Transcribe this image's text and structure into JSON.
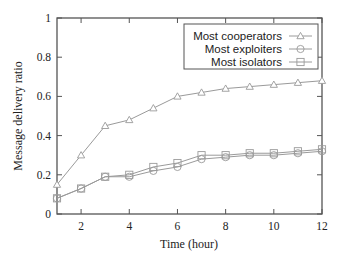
{
  "chart_data": {
    "type": "line",
    "title": "",
    "xlabel": "Time (hour)",
    "ylabel": "Message delivery ratio",
    "x": [
      1,
      2,
      3,
      4,
      5,
      6,
      7,
      8,
      9,
      10,
      11,
      12
    ],
    "xlim": [
      1,
      12
    ],
    "ylim": [
      0,
      1
    ],
    "xticks": [
      2,
      4,
      6,
      8,
      10,
      12
    ],
    "xtick_labels": [
      "2",
      "4",
      "6",
      "8",
      "10",
      "12"
    ],
    "yticks": [
      0,
      0.2,
      0.4,
      0.6,
      0.8,
      1
    ],
    "ytick_labels": [
      "0",
      "0.2",
      "0.4",
      "0.6",
      "0.8",
      "1"
    ],
    "grid": false,
    "legend_position": "upper right",
    "series": [
      {
        "name": "Most cooperators",
        "marker": "triangle",
        "values": [
          0.15,
          0.3,
          0.45,
          0.48,
          0.54,
          0.6,
          0.62,
          0.64,
          0.65,
          0.66,
          0.67,
          0.68
        ]
      },
      {
        "name": "Most exploiters",
        "marker": "circle",
        "values": [
          0.08,
          0.13,
          0.19,
          0.19,
          0.22,
          0.24,
          0.28,
          0.29,
          0.3,
          0.3,
          0.31,
          0.32
        ]
      },
      {
        "name": "Most isolators",
        "marker": "square",
        "values": [
          0.08,
          0.13,
          0.19,
          0.2,
          0.24,
          0.26,
          0.3,
          0.3,
          0.31,
          0.31,
          0.32,
          0.33
        ]
      }
    ],
    "colors": {
      "axis": "#555555",
      "series_line": "#9a9a9a",
      "text": "#222222"
    }
  }
}
